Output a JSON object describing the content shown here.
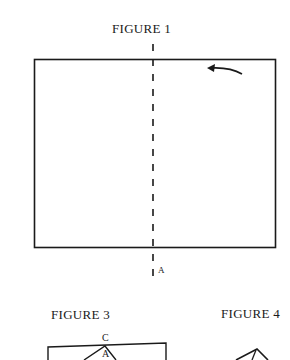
{
  "figures": [
    {
      "title": "FIGURE 1",
      "fold_line_label": "A",
      "elements": [
        "rectangle",
        "dashed-fold-line",
        "curved-arrow"
      ]
    },
    {
      "title": "FIGURE 3",
      "labels": [
        "C",
        "A"
      ],
      "elements": [
        "rectangle",
        "folded-triangle"
      ]
    },
    {
      "title": "FIGURE 4",
      "elements": [
        "folded-peak"
      ]
    }
  ],
  "colors": {
    "ink": "#1a1a1a",
    "background": "#ffffff"
  }
}
